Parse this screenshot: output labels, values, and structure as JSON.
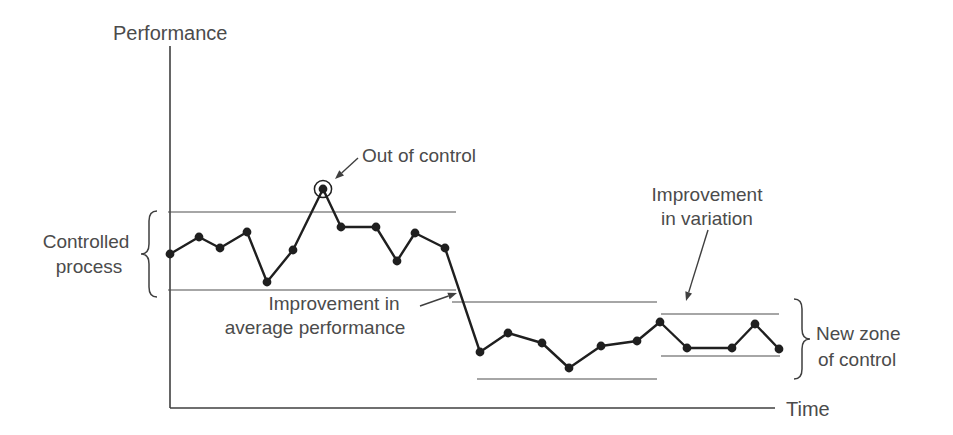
{
  "figure": {
    "background": "#ffffff",
    "ink": "#1f1f1f",
    "line_color": "#4e4e4e",
    "axis_color": "#3f3f3f",
    "text_color": "#4b4b4b"
  },
  "chart_data": {
    "type": "line",
    "title": "",
    "xlabel": "Time",
    "ylabel": "Performance",
    "canvas": {
      "width": 953,
      "height": 435
    },
    "axes": {
      "x0": 170,
      "y0": 408,
      "y_top": 46,
      "x_end": 775
    },
    "series": [
      {
        "name": "process performance",
        "points": [
          [
            170,
            254
          ],
          [
            199,
            237
          ],
          [
            220,
            248
          ],
          [
            247,
            232
          ],
          [
            267,
            282
          ],
          [
            293,
            250
          ],
          [
            323,
            189
          ],
          [
            341,
            227
          ],
          [
            376,
            227
          ],
          [
            397,
            261
          ],
          [
            415,
            233
          ],
          [
            445,
            248
          ],
          [
            480,
            352
          ],
          [
            508,
            333
          ],
          [
            542,
            343
          ],
          [
            569,
            368
          ],
          [
            601,
            346
          ],
          [
            637,
            341
          ],
          [
            660,
            322
          ],
          [
            687,
            348
          ],
          [
            732,
            348
          ],
          [
            755,
            324
          ],
          [
            779,
            349
          ]
        ],
        "out_of_control_index": 6
      }
    ],
    "control_limits": [
      {
        "name": "original-upper-limit",
        "y": 212,
        "x1": 168,
        "x2": 456
      },
      {
        "name": "original-lower-limit",
        "y": 290,
        "x1": 168,
        "x2": 456
      },
      {
        "name": "improved-upper-limit",
        "y": 302,
        "x1": 452,
        "x2": 657
      },
      {
        "name": "improved-lower-limit",
        "y": 379,
        "x1": 477,
        "x2": 657
      },
      {
        "name": "new-zone-upper-limit",
        "y": 314,
        "x1": 661,
        "x2": 779
      },
      {
        "name": "new-zone-lower-limit",
        "y": 356,
        "x1": 661,
        "x2": 780
      }
    ],
    "arrows": [
      {
        "name": "out-of-control-arrow",
        "x1": 358,
        "y1": 158,
        "x2": 335,
        "y2": 179
      },
      {
        "name": "average-improvement-arrow",
        "x1": 420,
        "y1": 306,
        "x2": 457,
        "y2": 293
      },
      {
        "name": "variation-improvement-arrow",
        "x1": 708,
        "y1": 230,
        "x2": 686,
        "y2": 301
      }
    ],
    "braces": [
      {
        "name": "controlled-process-brace",
        "side": "left",
        "x": 149,
        "depth": 8,
        "curl": 10,
        "y1": 211,
        "y2": 297
      },
      {
        "name": "new-zone-brace",
        "side": "right",
        "x": 802,
        "depth": 8,
        "curl": 10,
        "y1": 299,
        "y2": 379
      }
    ],
    "text_labels": [
      {
        "name": "y-axis-label",
        "text": "Performance",
        "x": 113,
        "y": 40,
        "anchor": "start",
        "size": 20
      },
      {
        "name": "x-axis-label",
        "text": "Time",
        "x": 786,
        "y": 416,
        "anchor": "start",
        "size": 20
      },
      {
        "name": "out-of-control-label",
        "text": "Out of control",
        "x": 362,
        "y": 162,
        "anchor": "start",
        "size": 19
      },
      {
        "name": "controlled-process-label-line1",
        "text": "Controlled",
        "x": 86,
        "y": 248,
        "anchor": "middle",
        "size": 19
      },
      {
        "name": "controlled-process-label-line2",
        "text": "process",
        "x": 89,
        "y": 273,
        "anchor": "middle",
        "size": 19
      },
      {
        "name": "average-improvement-label-line1",
        "text": "Improvement in",
        "x": 334,
        "y": 310,
        "anchor": "middle",
        "size": 19
      },
      {
        "name": "average-improvement-label-line2",
        "text": "average performance",
        "x": 315,
        "y": 334,
        "anchor": "middle",
        "size": 19
      },
      {
        "name": "variation-improvement-label-line1",
        "text": "Improvement",
        "x": 707,
        "y": 201,
        "anchor": "middle",
        "size": 19
      },
      {
        "name": "variation-improvement-label-line2",
        "text": "in variation",
        "x": 707,
        "y": 225,
        "anchor": "middle",
        "size": 19
      },
      {
        "name": "new-zone-label-line1",
        "text": "New zone",
        "x": 816,
        "y": 340,
        "anchor": "start",
        "size": 19
      },
      {
        "name": "new-zone-label-line2",
        "text": "of control",
        "x": 818,
        "y": 366,
        "anchor": "start",
        "size": 19
      }
    ]
  }
}
